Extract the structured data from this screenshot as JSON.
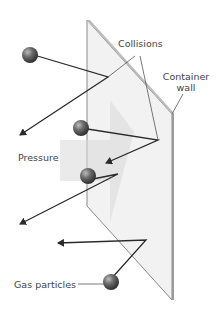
{
  "diagram": {
    "labels": {
      "collisions": "Collisions",
      "container_wall_line1": "Container",
      "container_wall_line2": "wall",
      "pressure": "Pressure",
      "gas_particles": "Gas particles"
    },
    "colors": {
      "wall_fill": "#f0f0f0",
      "wall_edge": "#8a8a8a",
      "arrow_fill": "#e2e2e2",
      "particle": "#5a5a5a",
      "path_line": "#2a2a2a",
      "label_text": "#444444"
    }
  }
}
